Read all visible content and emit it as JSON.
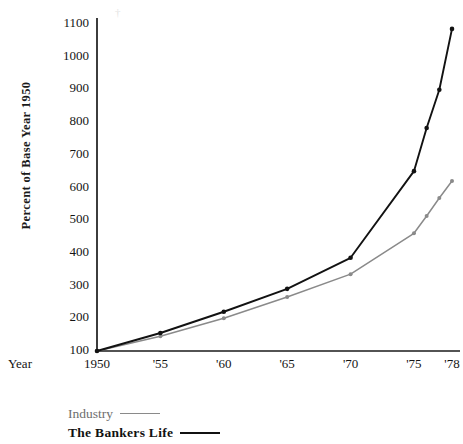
{
  "chart_data": {
    "type": "line",
    "title": "",
    "xlabel": "Year",
    "ylabel": "Percent of Base Year 1950",
    "x": [
      1950,
      1955,
      1960,
      1965,
      1970,
      1975,
      1976,
      1977,
      1978
    ],
    "categories": [
      "1950",
      "'55",
      "'60",
      "'65",
      "'70",
      "'75",
      "'76",
      "'77",
      "'78"
    ],
    "xtick_labels": [
      "1950",
      "'55",
      "'60",
      "'65",
      "'70",
      "'75",
      "'78"
    ],
    "xtick_values": [
      1950,
      1955,
      1960,
      1965,
      1970,
      1975,
      1978
    ],
    "ytick_labels": [
      "100",
      "200",
      "300",
      "400",
      "500",
      "600",
      "700",
      "800",
      "900",
      "1000",
      "1100"
    ],
    "ytick_values": [
      100,
      200,
      300,
      400,
      500,
      600,
      700,
      800,
      900,
      1000,
      1100
    ],
    "ylim": [
      60,
      1140
    ],
    "xlim": [
      1949,
      1979.5
    ],
    "grid": false,
    "legend_position": "below-left",
    "series": [
      {
        "name": "Industry",
        "color": "#8a8a8a",
        "marker": "dot",
        "values": [
          100,
          145,
          200,
          265,
          335,
          460,
          513,
          568,
          620
        ]
      },
      {
        "name": "The Bankers Life",
        "color": "#121212",
        "marker": "dot",
        "values": [
          100,
          155,
          220,
          290,
          385,
          650,
          782,
          899,
          1085
        ]
      }
    ]
  },
  "axis": {
    "year_label": "Year"
  },
  "legend": {
    "items": [
      {
        "label": "Industry"
      },
      {
        "label": "The Bankers Life"
      }
    ]
  }
}
